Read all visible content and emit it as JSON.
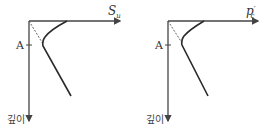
{
  "diagram": {
    "panels": [
      {
        "id": "left",
        "x_axis_label": "S",
        "x_axis_subscript": "u",
        "y_axis_label": "깊이",
        "tick_label": "A",
        "description": "Undrained shear strength vs depth"
      },
      {
        "id": "right",
        "x_axis_label": "p",
        "x_axis_prime": "′",
        "x_axis_subscript": "c",
        "y_axis_label": "깊이",
        "tick_label": "A",
        "description": "Preconsolidation pressure vs depth"
      }
    ],
    "colors": {
      "axis": "#444444",
      "curve": "#2a2a2a",
      "dashed": "#555555",
      "background": "#ffffff"
    }
  }
}
